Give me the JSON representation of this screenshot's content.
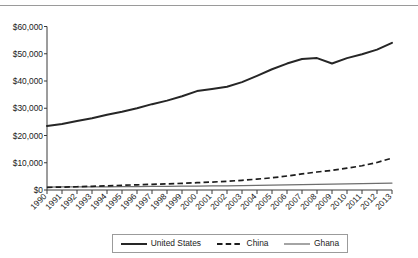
{
  "chart_data": {
    "type": "line",
    "title": "",
    "xlabel": "",
    "ylabel": "",
    "ylim": [
      0,
      60000
    ],
    "ytick_values": [
      0,
      10000,
      20000,
      30000,
      40000,
      50000,
      60000
    ],
    "ytick_labels": [
      "$0",
      "$10,000",
      "$20,000",
      "$30,000",
      "$40,000",
      "$50,000",
      "$60,000"
    ],
    "grid": false,
    "legend_position": "bottom",
    "x": [
      1990,
      1991,
      1992,
      1993,
      1994,
      1995,
      1996,
      1997,
      1998,
      1999,
      2000,
      2001,
      2002,
      2003,
      2004,
      2005,
      2006,
      2007,
      2008,
      2009,
      2010,
      2011,
      2012,
      2013
    ],
    "categories": [
      "1990",
      "1991",
      "1992",
      "1993",
      "1994",
      "1995",
      "1996",
      "1997",
      "1998",
      "1999",
      "2000",
      "2001",
      "2002",
      "2003",
      "2004",
      "2005",
      "2006",
      "2007",
      "2008",
      "2009",
      "2010",
      "2011",
      "2012",
      "2013"
    ],
    "series": [
      {
        "name": "United States",
        "style": "solid-thick",
        "color": "#262626",
        "values": [
          23500,
          24200,
          25300,
          26300,
          27600,
          28700,
          30000,
          31500,
          32800,
          34400,
          36300,
          37100,
          37900,
          39600,
          41900,
          44300,
          46400,
          48100,
          48400,
          46400,
          48400,
          49800,
          51500,
          54000
        ]
      },
      {
        "name": "China",
        "style": "dashed",
        "color": "#1c1c1c",
        "values": [
          980,
          1060,
          1190,
          1350,
          1530,
          1720,
          1900,
          2080,
          2250,
          2440,
          2670,
          2920,
          3200,
          3560,
          3980,
          4480,
          5130,
          5900,
          6600,
          7200,
          8000,
          8900,
          10100,
          11700
        ]
      },
      {
        "name": "Ghana",
        "style": "solid-thin",
        "color": "#6e6e6e",
        "values": [
          1080,
          1110,
          1130,
          1160,
          1180,
          1220,
          1260,
          1300,
          1340,
          1390,
          1420,
          1470,
          1530,
          1600,
          1680,
          1760,
          1870,
          1960,
          2060,
          2120,
          2230,
          2380,
          2450,
          2520
        ]
      }
    ]
  },
  "legend": {
    "items": [
      {
        "label": "United States",
        "swatch": "solid-thick-line-swatch"
      },
      {
        "label": "China",
        "swatch": "dashed-line-swatch"
      },
      {
        "label": "Ghana",
        "swatch": "solid-thin-line-swatch"
      }
    ]
  }
}
